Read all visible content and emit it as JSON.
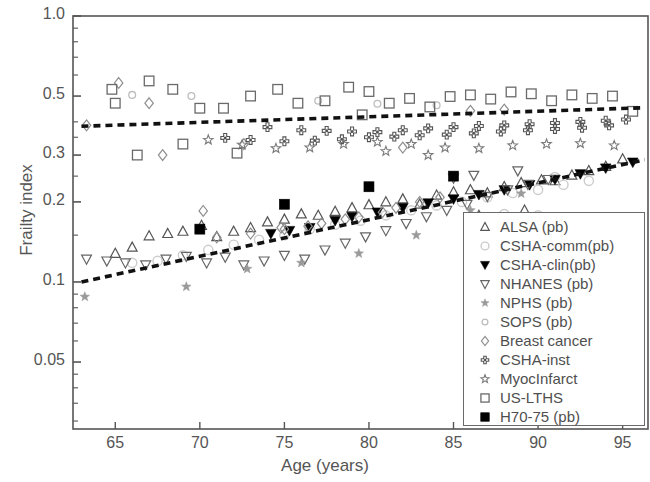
{
  "chart_data": {
    "type": "scatter",
    "title": "",
    "xlabel": "Age (years)",
    "ylabel": "Frailty index",
    "xlim": [
      62.5,
      96.5
    ],
    "ylim": [
      0.028,
      1.0
    ],
    "yscale": "log",
    "grid": false,
    "legend_position": "lower-right-inside",
    "xticks": [
      65,
      70,
      75,
      80,
      85,
      90,
      95
    ],
    "xtick_labels": [
      "65",
      "70",
      "75",
      "80",
      "85",
      "90",
      "95"
    ],
    "yticks": [
      1.0,
      0.5,
      0.3,
      0.2,
      0.1,
      0.05
    ],
    "ytick_labels": [
      "1.0",
      "0.5",
      "0.3",
      "0.2",
      "0.1",
      "0.05"
    ],
    "trendlines": [
      {
        "name": "institutional-trend",
        "style": "dashed",
        "color": "#111111",
        "x": [
          63.0,
          96.3
        ],
        "y": [
          0.385,
          0.452
        ]
      },
      {
        "name": "community-trend",
        "style": "dashed",
        "color": "#111111",
        "x": [
          63.0,
          96.3
        ],
        "y": [
          0.1,
          0.288
        ]
      }
    ],
    "series": [
      {
        "name": "ALSA (pb)",
        "marker": "triangle-up-open",
        "color": "#555555",
        "points": [
          [
            65.0,
            0.128
          ],
          [
            66.0,
            0.135
          ],
          [
            67.0,
            0.149
          ],
          [
            68.1,
            0.152
          ],
          [
            69.0,
            0.155
          ],
          [
            70.1,
            0.163
          ],
          [
            71.0,
            0.148
          ],
          [
            72.0,
            0.155
          ],
          [
            73.0,
            0.16
          ],
          [
            74.0,
            0.168
          ],
          [
            75.0,
            0.172
          ],
          [
            76.0,
            0.18
          ],
          [
            77.0,
            0.178
          ],
          [
            78.0,
            0.184
          ],
          [
            79.0,
            0.19
          ],
          [
            80.0,
            0.195
          ],
          [
            81.0,
            0.2
          ],
          [
            82.0,
            0.205
          ],
          [
            83.0,
            0.196
          ],
          [
            84.0,
            0.212
          ],
          [
            85.0,
            0.218
          ],
          [
            86.0,
            0.222
          ],
          [
            87.0,
            0.216
          ],
          [
            88.0,
            0.228
          ],
          [
            89.0,
            0.236
          ],
          [
            90.2,
            0.242
          ],
          [
            91.0,
            0.24
          ],
          [
            92.0,
            0.252
          ],
          [
            93.0,
            0.262
          ],
          [
            94.0,
            0.272
          ],
          [
            95.0,
            0.29
          ],
          [
            89.2,
            0.186
          ],
          [
            86.5,
            0.178
          ]
        ]
      },
      {
        "name": "CSHA-comm(pb)",
        "marker": "circle-open",
        "color": "#cccccc",
        "points": [
          [
            66.0,
            0.118
          ],
          [
            67.5,
            0.12
          ],
          [
            69.0,
            0.126
          ],
          [
            70.5,
            0.132
          ],
          [
            72.0,
            0.138
          ],
          [
            73.5,
            0.144
          ],
          [
            75.0,
            0.15
          ],
          [
            76.5,
            0.158
          ],
          [
            78.0,
            0.164
          ],
          [
            79.5,
            0.17
          ],
          [
            81.0,
            0.178
          ],
          [
            82.5,
            0.186
          ],
          [
            84.0,
            0.194
          ],
          [
            85.5,
            0.2
          ],
          [
            87.0,
            0.208
          ],
          [
            88.5,
            0.216
          ],
          [
            90.0,
            0.222
          ],
          [
            91.5,
            0.232
          ],
          [
            93.0,
            0.24
          ],
          [
            88.0,
            0.18
          ],
          [
            90.0,
            0.178
          ],
          [
            91.0,
            0.248
          ]
        ]
      },
      {
        "name": "CSHA-clin(pb)",
        "marker": "triangle-down-filled",
        "color": "#000000",
        "points": [
          [
            74.2,
            0.152
          ],
          [
            75.3,
            0.156
          ],
          [
            76.5,
            0.16
          ],
          [
            78.0,
            0.17
          ],
          [
            79.0,
            0.176
          ],
          [
            80.5,
            0.183
          ],
          [
            82.0,
            0.19
          ],
          [
            83.5,
            0.198
          ],
          [
            85.0,
            0.205
          ],
          [
            86.5,
            0.213
          ],
          [
            88.0,
            0.222
          ],
          [
            89.5,
            0.232
          ],
          [
            91.0,
            0.243
          ],
          [
            92.5,
            0.255
          ],
          [
            94.0,
            0.268
          ],
          [
            95.6,
            0.282
          ]
        ]
      },
      {
        "name": "NHANES (pb)",
        "marker": "triangle-down-open",
        "color": "#666666",
        "points": [
          [
            63.3,
            0.122
          ],
          [
            64.5,
            0.12
          ],
          [
            65.6,
            0.118
          ],
          [
            66.8,
            0.116
          ],
          [
            68.0,
            0.122
          ],
          [
            69.2,
            0.125
          ],
          [
            70.4,
            0.118
          ],
          [
            71.5,
            0.124
          ],
          [
            72.6,
            0.116
          ],
          [
            73.8,
            0.12
          ],
          [
            75.0,
            0.126
          ],
          [
            76.2,
            0.122
          ],
          [
            77.4,
            0.132
          ],
          [
            78.6,
            0.14
          ],
          [
            79.8,
            0.148
          ],
          [
            81.0,
            0.156
          ],
          [
            82.2,
            0.166
          ],
          [
            83.4,
            0.176
          ],
          [
            84.6,
            0.186
          ],
          [
            85.8,
            0.196
          ],
          [
            87.0,
            0.21
          ],
          [
            88.2,
            0.222
          ],
          [
            89.4,
            0.233
          ],
          [
            90.6,
            0.243
          ],
          [
            85.0,
            0.246
          ],
          [
            86.2,
            0.252
          ],
          [
            88.8,
            0.262
          ]
        ]
      },
      {
        "name": "NPHS (pb)",
        "marker": "star-gray",
        "color": "#9a9a9a",
        "points": [
          [
            63.2,
            0.088
          ],
          [
            69.2,
            0.096
          ],
          [
            72.8,
            0.112
          ],
          [
            76.0,
            0.118
          ],
          [
            79.4,
            0.128
          ],
          [
            82.8,
            0.15
          ],
          [
            86.0,
            0.186
          ],
          [
            89.0,
            0.215
          ]
        ]
      },
      {
        "name": "SOPS (pb)",
        "marker": "circle-small-open",
        "color": "#bdbdbd",
        "points": [
          [
            66.0,
            0.505
          ],
          [
            69.5,
            0.5
          ],
          [
            77.0,
            0.48
          ],
          [
            80.5,
            0.468
          ],
          [
            84.0,
            0.462
          ]
        ]
      },
      {
        "name": "Breast cancer",
        "marker": "diamond-open",
        "color": "#8e8e8e",
        "points": [
          [
            63.3,
            0.388
          ],
          [
            65.2,
            0.56
          ],
          [
            67.0,
            0.47
          ],
          [
            70.2,
            0.185
          ],
          [
            72.6,
            0.33
          ],
          [
            74.8,
            0.16
          ],
          [
            76.4,
            0.162
          ],
          [
            78.6,
            0.172
          ],
          [
            80.8,
            0.183
          ],
          [
            67.8,
            0.3
          ],
          [
            71.0,
            0.147
          ],
          [
            73.0,
            0.152
          ],
          [
            75.0,
            0.158
          ],
          [
            77.2,
            0.166
          ],
          [
            79.4,
            0.175
          ],
          [
            81.6,
            0.19
          ],
          [
            83.0,
            0.2
          ],
          [
            84.2,
            0.208
          ],
          [
            82.0,
            0.32
          ],
          [
            86.0,
            0.44
          ],
          [
            88.0,
            0.445
          ]
        ]
      },
      {
        "name": "CSHA-inst",
        "marker": "cross-dot",
        "color": "#555555",
        "points": [
          [
            74.0,
            0.382
          ],
          [
            76.0,
            0.372
          ],
          [
            77.5,
            0.37
          ],
          [
            79.0,
            0.368
          ],
          [
            80.5,
            0.366
          ],
          [
            82.0,
            0.372
          ],
          [
            83.5,
            0.378
          ],
          [
            85.0,
            0.382
          ],
          [
            86.5,
            0.386
          ],
          [
            88.0,
            0.388
          ],
          [
            89.5,
            0.392
          ],
          [
            91.0,
            0.396
          ],
          [
            92.5,
            0.4
          ],
          [
            94.0,
            0.404
          ],
          [
            95.2,
            0.408
          ],
          [
            71.5,
            0.348
          ],
          [
            73.0,
            0.342
          ],
          [
            75.0,
            0.338
          ],
          [
            76.8,
            0.34
          ],
          [
            78.4,
            0.344
          ],
          [
            80.0,
            0.35
          ],
          [
            81.5,
            0.352
          ],
          [
            83.0,
            0.356
          ],
          [
            84.6,
            0.358
          ],
          [
            86.2,
            0.362
          ],
          [
            87.8,
            0.368
          ],
          [
            89.4,
            0.372
          ],
          [
            91.0,
            0.376
          ],
          [
            92.6,
            0.38
          ],
          [
            94.2,
            0.388
          ]
        ]
      },
      {
        "name": "MyocInfarct",
        "marker": "star-open",
        "color": "#7a7a7a",
        "points": [
          [
            70.5,
            0.342
          ],
          [
            72.5,
            0.328
          ],
          [
            74.5,
            0.318
          ],
          [
            76.5,
            0.32
          ],
          [
            78.5,
            0.33
          ],
          [
            80.5,
            0.336
          ],
          [
            82.5,
            0.33
          ],
          [
            84.5,
            0.32
          ],
          [
            86.5,
            0.318
          ],
          [
            88.5,
            0.326
          ],
          [
            90.5,
            0.33
          ],
          [
            92.5,
            0.332
          ],
          [
            94.5,
            0.326
          ],
          [
            83.5,
            0.3
          ],
          [
            81.0,
            0.31
          ]
        ]
      },
      {
        "name": "US-LTHS",
        "marker": "square-open",
        "color": "#6a6a6a",
        "points": [
          [
            64.8,
            0.53
          ],
          [
            65.0,
            0.47
          ],
          [
            67.0,
            0.57
          ],
          [
            68.4,
            0.53
          ],
          [
            66.3,
            0.3
          ],
          [
            70.0,
            0.45
          ],
          [
            71.4,
            0.45
          ],
          [
            73.0,
            0.5
          ],
          [
            74.6,
            0.53
          ],
          [
            75.8,
            0.47
          ],
          [
            77.4,
            0.48
          ],
          [
            78.8,
            0.54
          ],
          [
            80.0,
            0.52
          ],
          [
            81.2,
            0.47
          ],
          [
            82.4,
            0.49
          ],
          [
            83.6,
            0.455
          ],
          [
            84.8,
            0.498
          ],
          [
            86.0,
            0.505
          ],
          [
            87.2,
            0.487
          ],
          [
            88.4,
            0.518
          ],
          [
            89.6,
            0.51
          ],
          [
            90.8,
            0.48
          ],
          [
            92.0,
            0.505
          ],
          [
            93.2,
            0.49
          ],
          [
            94.4,
            0.5
          ],
          [
            69.0,
            0.33
          ],
          [
            72.2,
            0.305
          ],
          [
            95.6,
            0.438
          ],
          [
            79.6,
            0.425
          ]
        ]
      },
      {
        "name": "H70-75 (pb)",
        "marker": "square-filled",
        "color": "#000000",
        "points": [
          [
            70.0,
            0.158
          ],
          [
            75.0,
            0.196
          ],
          [
            80.0,
            0.228
          ],
          [
            85.0,
            0.25
          ]
        ]
      }
    ]
  },
  "legend": {
    "items": [
      {
        "label": "ALSA (pb)",
        "marker": "triangle-up-open"
      },
      {
        "label": "CSHA-comm(pb)",
        "marker": "circle-open"
      },
      {
        "label": "CSHA-clin(pb)",
        "marker": "triangle-down-filled"
      },
      {
        "label": "NHANES (pb)",
        "marker": "triangle-down-open"
      },
      {
        "label": "NPHS (pb)",
        "marker": "star-gray"
      },
      {
        "label": "SOPS (pb)",
        "marker": "circle-small-open"
      },
      {
        "label": "Breast cancer",
        "marker": "diamond-open"
      },
      {
        "label": "CSHA-inst",
        "marker": "cross-dot"
      },
      {
        "label": "MyocInfarct",
        "marker": "star-open"
      },
      {
        "label": "US-LTHS",
        "marker": "square-open"
      },
      {
        "label": "H70-75 (pb)",
        "marker": "square-filled"
      }
    ]
  },
  "colors": {
    "axis": "#555555",
    "frame": "#555555",
    "trendline": "#111111",
    "text": "#4f4f4f"
  }
}
